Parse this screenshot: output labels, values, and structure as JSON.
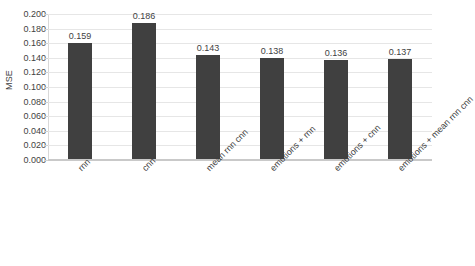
{
  "chart_data": {
    "type": "bar",
    "title": "",
    "subtitle": "",
    "xlabel": "",
    "ylabel": "MSE",
    "ylim": [
      0.0,
      0.2
    ],
    "ytick_labels": [
      "0.200",
      "0.180",
      "0.160",
      "0.140",
      "0.120",
      "0.100",
      "0.080",
      "0.060",
      "0.040",
      "0.020",
      "0.000"
    ],
    "ytick_values": [
      0.2,
      0.18,
      0.16,
      0.14,
      0.12,
      0.1,
      0.08,
      0.06,
      0.04,
      0.02,
      0.0
    ],
    "ytick_step": 0.02,
    "grid": "horizontal",
    "legend": "none",
    "orientation": "vertical",
    "categories": [
      "rnn",
      "cnn",
      "mean rnn cnn",
      "emotions + rnn",
      "emotions + cnn",
      "emotions + mean rnn cnn"
    ],
    "values": [
      0.159,
      0.186,
      0.143,
      0.138,
      0.136,
      0.137
    ],
    "data_labels": [
      "0.159",
      "0.186",
      "0.143",
      "0.138",
      "0.136",
      "0.137"
    ],
    "bar_color": "#404040",
    "gridline_color": "#E6E6E6",
    "axis_color": "#C9C9C9",
    "text_color": "#3F3F3F",
    "background_color": "#FFFFFF",
    "category_label_rotation_deg": -45
  }
}
